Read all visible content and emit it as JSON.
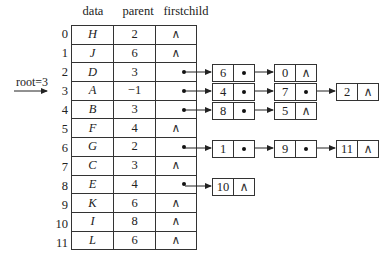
{
  "headers": {
    "data": "data",
    "parent": "parent",
    "firstchild": "firstchild"
  },
  "root_label": "root=3",
  "null_symbol": "∧",
  "rows": [
    {
      "index": "0",
      "data": "H",
      "parent": "2",
      "firstchild": "∧"
    },
    {
      "index": "1",
      "data": "J",
      "parent": "6",
      "firstchild": "∧"
    },
    {
      "index": "2",
      "data": "D",
      "parent": "3",
      "firstchild": "•"
    },
    {
      "index": "3",
      "data": "A",
      "parent": "−1",
      "firstchild": "•"
    },
    {
      "index": "4",
      "data": "B",
      "parent": "3",
      "firstchild": "•"
    },
    {
      "index": "5",
      "data": "F",
      "parent": "4",
      "firstchild": "∧"
    },
    {
      "index": "6",
      "data": "G",
      "parent": "2",
      "firstchild": "•"
    },
    {
      "index": "7",
      "data": "C",
      "parent": "3",
      "firstchild": "∧"
    },
    {
      "index": "8",
      "data": "E",
      "parent": "4",
      "firstchild": "•"
    },
    {
      "index": "9",
      "data": "K",
      "parent": "6",
      "firstchild": "∧"
    },
    {
      "index": "10",
      "data": "I",
      "parent": "8",
      "firstchild": "∧"
    },
    {
      "index": "11",
      "data": "L",
      "parent": "6",
      "firstchild": "∧"
    }
  ],
  "child_lists": {
    "row2": [
      "6",
      "0"
    ],
    "row3": [
      "4",
      "7",
      "2"
    ],
    "row4": [
      "8",
      "5"
    ],
    "row6": [
      "1",
      "9",
      "11"
    ],
    "row8": [
      "10"
    ]
  }
}
